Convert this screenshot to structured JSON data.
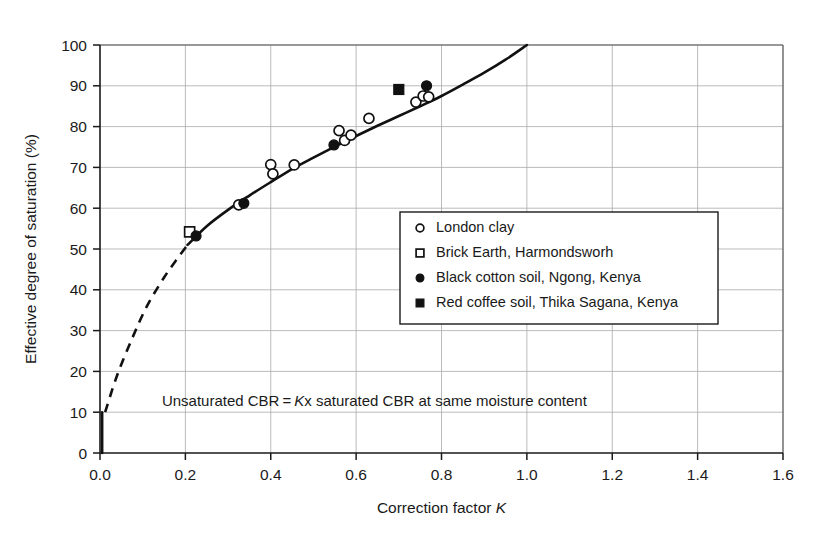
{
  "chart_data": {
    "type": "scatter",
    "title": "",
    "xlabel": "Correction factor K",
    "ylabel": "Effective degree of saturation (%)",
    "xlim": [
      0.0,
      1.6
    ],
    "ylim": [
      0,
      100
    ],
    "grid": true,
    "legend_position": "center-right",
    "x_ticks": [
      "0.0",
      "0.2",
      "0.4",
      "0.6",
      "0.8",
      "1.0",
      "1.2",
      "1.4",
      "1.6"
    ],
    "x_tick_values": [
      0.0,
      0.2,
      0.4,
      0.6,
      0.8,
      1.0,
      1.2,
      1.4,
      1.6
    ],
    "y_ticks": [
      "0",
      "10",
      "20",
      "30",
      "40",
      "50",
      "60",
      "70",
      "80",
      "90",
      "100"
    ],
    "y_tick_values": [
      0,
      10,
      20,
      30,
      40,
      50,
      60,
      70,
      80,
      90,
      100
    ],
    "annotation": "Unsaturated CBR = Kx saturated CBR at same moisture content",
    "annotation_parts": {
      "before": "Unsaturated CBR = ",
      "italic": "K",
      "after": "x saturated CBR at same moisture content"
    },
    "series": [
      {
        "name": "London clay",
        "marker": "open-circle",
        "color": "#111111",
        "points": [
          [
            0.4,
            70.7
          ],
          [
            0.405,
            68.4
          ],
          [
            0.455,
            70.6
          ],
          [
            0.325,
            60.8
          ],
          [
            0.56,
            79.0
          ],
          [
            0.573,
            76.6
          ],
          [
            0.588,
            77.9
          ],
          [
            0.63,
            82.0
          ],
          [
            0.74,
            86.0
          ],
          [
            0.757,
            87.5
          ],
          [
            0.77,
            87.3
          ]
        ]
      },
      {
        "name": "Brick Earth, Harmondsworh",
        "marker": "open-square",
        "color": "#111111",
        "points": [
          [
            0.21,
            54.2
          ]
        ]
      },
      {
        "name": "Black cotton soil, Ngong, Kenya",
        "marker": "filled-circle",
        "color": "#111111",
        "points": [
          [
            0.225,
            53.2
          ],
          [
            0.337,
            61.2
          ],
          [
            0.548,
            75.5
          ],
          [
            0.765,
            90.0
          ]
        ]
      },
      {
        "name": "Red coffee soil, Thika Sagana, Kenya",
        "marker": "filled-square",
        "color": "#111111",
        "points": [
          [
            0.7,
            89.1
          ]
        ]
      }
    ],
    "fit_curve": {
      "name": "fitted correction curve",
      "style": "solid",
      "points": [
        [
          0.205,
          51.0
        ],
        [
          0.25,
          55.6
        ],
        [
          0.3,
          59.6
        ],
        [
          0.35,
          63.1
        ],
        [
          0.4,
          66.4
        ],
        [
          0.45,
          69.6
        ],
        [
          0.5,
          72.4
        ],
        [
          0.55,
          75.1
        ],
        [
          0.6,
          77.7
        ],
        [
          0.65,
          80.2
        ],
        [
          0.7,
          82.6
        ],
        [
          0.75,
          85.0
        ],
        [
          0.8,
          87.5
        ],
        [
          0.85,
          90.3
        ],
        [
          0.9,
          93.2
        ],
        [
          0.95,
          96.4
        ],
        [
          1.0,
          100.0
        ]
      ]
    },
    "extrapolation_curve": {
      "name": "extrapolated dashed segment",
      "style": "dashed",
      "points": [
        [
          0.012,
          10.0
        ],
        [
          0.04,
          19.0
        ],
        [
          0.075,
          28.0
        ],
        [
          0.11,
          36.0
        ],
        [
          0.15,
          43.0
        ],
        [
          0.18,
          47.5
        ],
        [
          0.205,
          51.0
        ]
      ]
    },
    "vertical_stub": {
      "name": "origin vertical stub",
      "x": 0.005,
      "y_from": 0.0,
      "y_to": 10.0
    }
  },
  "legend": {
    "items": [
      {
        "label": "London clay",
        "marker": "open-circle"
      },
      {
        "label": "Brick Earth, Harmondsworh",
        "marker": "open-square"
      },
      {
        "label": "Black cotton soil, Ngong, Kenya",
        "marker": "filled-circle"
      },
      {
        "label": "Red coffee soil, Thika Sagana, Kenya",
        "marker": "filled-square"
      }
    ]
  },
  "axes": {
    "x_title_before": "Correction factor ",
    "x_title_italic": "K",
    "y_title": "Effective degree of saturation (%)"
  },
  "colors": {
    "ink": "#111111",
    "grid": "#aaaaaa",
    "background": "#ffffff"
  }
}
